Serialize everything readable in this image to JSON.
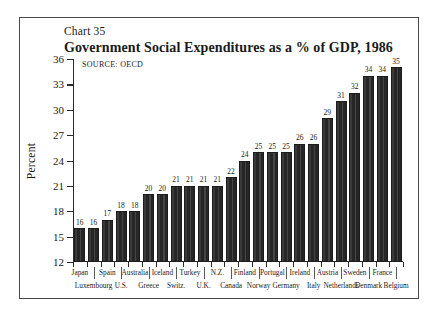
{
  "figure": {
    "chart_number": "Chart 35",
    "title": "Government Social Expenditures as a % of GDP, 1986",
    "source": "SOURCE:  OECD"
  },
  "chart_data": {
    "type": "bar",
    "title": "Government Social Expenditures as a % of GDP, 1986",
    "subtitle": "Chart 35",
    "source": "SOURCE:  OECD",
    "xlabel": "",
    "ylabel": "Percent",
    "ylim": [
      12,
      36
    ],
    "yticks": [
      12,
      15,
      18,
      21,
      24,
      27,
      30,
      33,
      36
    ],
    "grid": false,
    "legend": "none",
    "bar_color": "#2f2f2f",
    "categories": [
      "Japan",
      "Luxembourg",
      "Spain",
      "U.S.",
      "Australia",
      "Greece",
      "Iceland",
      "Switz.",
      "Turkey",
      "U.K.",
      "N.Z.",
      "Canada",
      "Finland",
      "Norway",
      "Portugal",
      "Germany",
      "Ireland",
      "Italy",
      "Austria",
      "Netherlands",
      "Sweden",
      "Denmark",
      "France",
      "Belgium"
    ],
    "values": [
      16,
      16,
      17,
      18,
      18,
      20,
      20,
      21,
      21,
      21,
      21,
      22,
      24,
      25,
      25,
      25,
      26,
      26,
      29,
      31,
      32,
      34,
      34,
      35
    ],
    "labels_top_row": [
      "Japan",
      "Spain",
      "Australia",
      "Iceland",
      "Turkey",
      "N.Z.",
      "Finland",
      "Portugal",
      "Ireland",
      "Austria",
      "Sweden",
      "France"
    ],
    "labels_bottom_row": [
      "Luxembourg",
      "U.S.",
      "Greece",
      "Switz.",
      "U.K.",
      "Canada",
      "Norway",
      "Germany",
      "Italy",
      "Netherlands",
      "Denmark",
      "Belgium"
    ]
  }
}
